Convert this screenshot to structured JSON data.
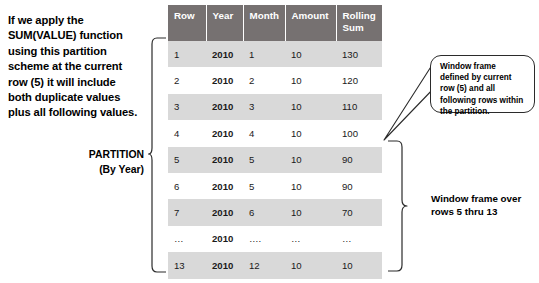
{
  "intro": {
    "lines": [
      "If we apply the",
      "SUM(VALUE) function",
      "using this partition",
      "scheme at the current",
      "row (5) it will include",
      "both duplicate values",
      "plus all following values."
    ]
  },
  "partition_label": {
    "lines": [
      "PARTITION",
      "(By Year)"
    ]
  },
  "table": {
    "headers": [
      "Row",
      "Year",
      "Month",
      "Amount",
      "Rolling Sum"
    ],
    "header_lines": {
      "rolling_sum": [
        "Rolling",
        "Sum"
      ]
    },
    "rows": [
      {
        "row": "1",
        "year": "2010",
        "month": "1",
        "amount": "10",
        "rolling_sum": "130"
      },
      {
        "row": "2",
        "year": "2010",
        "month": "2",
        "amount": "10",
        "rolling_sum": "120"
      },
      {
        "row": "3",
        "year": "2010",
        "month": "3",
        "amount": "10",
        "rolling_sum": "110"
      },
      {
        "row": "4",
        "year": "2010",
        "month": "4",
        "amount": "10",
        "rolling_sum": "100"
      },
      {
        "row": "5",
        "year": "2010",
        "month": "5",
        "amount": "10",
        "rolling_sum": "90"
      },
      {
        "row": "6",
        "year": "2010",
        "month": "5",
        "amount": "10",
        "rolling_sum": "90"
      },
      {
        "row": "7",
        "year": "2010",
        "month": "6",
        "amount": "10",
        "rolling_sum": "70"
      },
      {
        "row": "…",
        "year": "2010",
        "month": "….",
        "amount": "…",
        "rolling_sum": "…"
      },
      {
        "row": "13",
        "year": "2010",
        "month": "12",
        "amount": "10",
        "rolling_sum": "10"
      }
    ]
  },
  "callout": {
    "lines": [
      "Window frame",
      "defined by current",
      "row (5) and all",
      "following rows within",
      "the partition."
    ]
  },
  "frame_label": {
    "lines": [
      "Window frame over",
      "rows 5 thru 13"
    ]
  },
  "colors": {
    "header_fill": "#767171",
    "header_text": "#ffffff",
    "row_shade": "#d9d9d9",
    "row_plain": "#ffffff",
    "text": "#000000",
    "line": "#2b2b2b"
  }
}
